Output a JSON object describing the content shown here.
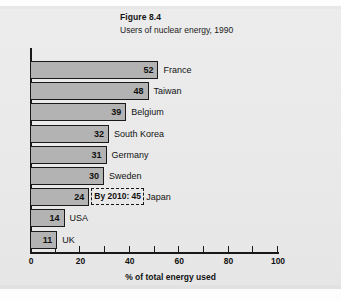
{
  "figure": {
    "title": "Figure 8.4",
    "subtitle": "Users of nuclear energy, 1990"
  },
  "axis": {
    "x_title": "% of total energy used",
    "tick_labels": [
      "0",
      "20",
      "40",
      "60",
      "80",
      "100"
    ]
  },
  "annotation": {
    "japan_forecast": "By 2010: 45"
  },
  "chart_data": {
    "type": "bar",
    "orientation": "horizontal",
    "title": "Figure 8.4",
    "subtitle": "Users of nuclear energy, 1990",
    "xlabel": "% of total energy used",
    "ylabel": "",
    "xlim": [
      0,
      100
    ],
    "xticks": [
      0,
      10,
      20,
      30,
      40,
      50,
      60,
      70,
      80,
      90,
      100
    ],
    "xtick_labels": [
      "0",
      "",
      "20",
      "",
      "40",
      "",
      "60",
      "",
      "80",
      "",
      "100"
    ],
    "grid": false,
    "legend": "none",
    "bar_color": "#b3b3b3",
    "bar_edge_color": "#1a1a1a",
    "categories": [
      "France",
      "Taiwan",
      "Belgium",
      "South Korea",
      "Germany",
      "Sweden",
      "Japan",
      "USA",
      "UK"
    ],
    "values": [
      52,
      48,
      39,
      32,
      31,
      30,
      24,
      14,
      11
    ],
    "value_labels": [
      "52",
      "48",
      "39",
      "32",
      "31",
      "30",
      "24",
      "14",
      "11"
    ],
    "annotations": [
      {
        "category": "Japan",
        "text": "By 2010: 45",
        "style": "dashed-box"
      }
    ]
  }
}
